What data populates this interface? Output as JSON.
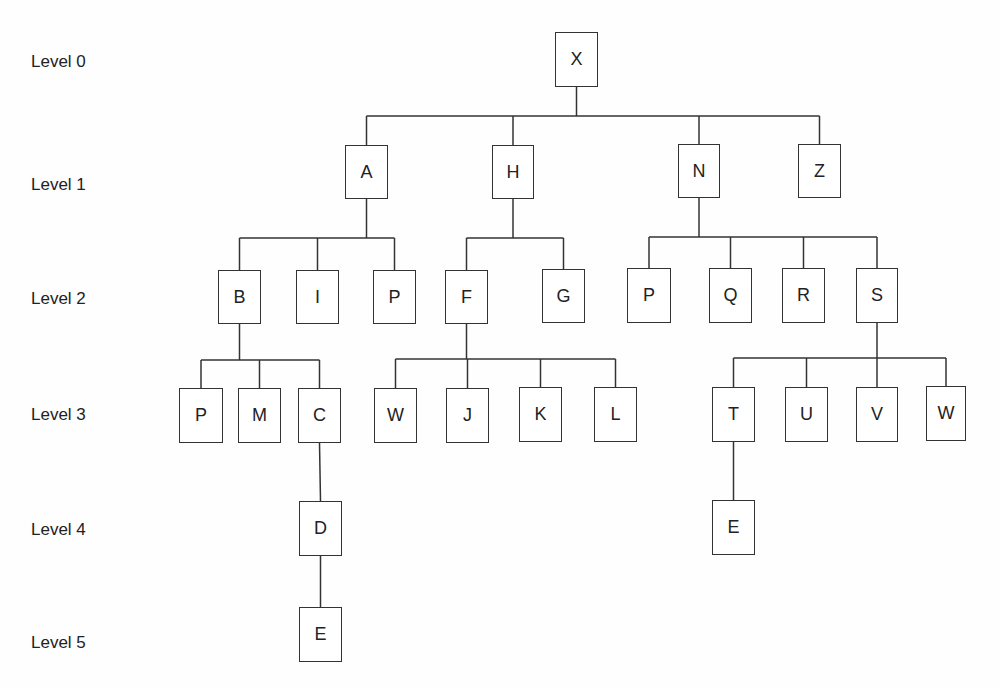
{
  "diagram": {
    "type": "tree",
    "levels": [
      {
        "label": "Level 0",
        "y": 62
      },
      {
        "label": "Level 1",
        "y": 185
      },
      {
        "label": "Level 2",
        "y": 299
      },
      {
        "label": "Level 3",
        "y": 415
      },
      {
        "label": "Level 4",
        "y": 530
      },
      {
        "label": "Level 5",
        "y": 643
      }
    ],
    "nodes": [
      {
        "id": "X",
        "label": "X",
        "level": 0,
        "x": 555,
        "y": 32,
        "w": 43,
        "h": 55
      },
      {
        "id": "A",
        "label": "A",
        "level": 1,
        "x": 345,
        "y": 145,
        "w": 43,
        "h": 54
      },
      {
        "id": "H",
        "label": "H",
        "level": 1,
        "x": 492,
        "y": 145,
        "w": 42,
        "h": 54
      },
      {
        "id": "N",
        "label": "N",
        "level": 1,
        "x": 678,
        "y": 144,
        "w": 42,
        "h": 54
      },
      {
        "id": "Z",
        "label": "Z",
        "level": 1,
        "x": 798,
        "y": 144,
        "w": 43,
        "h": 54
      },
      {
        "id": "B",
        "label": "B",
        "level": 2,
        "x": 218,
        "y": 270,
        "w": 43,
        "h": 54
      },
      {
        "id": "I",
        "label": "I",
        "level": 2,
        "x": 296,
        "y": 270,
        "w": 43,
        "h": 54
      },
      {
        "id": "P1",
        "label": "P",
        "level": 2,
        "x": 373,
        "y": 270,
        "w": 43,
        "h": 54
      },
      {
        "id": "F",
        "label": "F",
        "level": 2,
        "x": 445,
        "y": 270,
        "w": 43,
        "h": 54
      },
      {
        "id": "G",
        "label": "G",
        "level": 2,
        "x": 542,
        "y": 269,
        "w": 43,
        "h": 54
      },
      {
        "id": "P2",
        "label": "P",
        "level": 2,
        "x": 627,
        "y": 268,
        "w": 44,
        "h": 55
      },
      {
        "id": "Q",
        "label": "Q",
        "level": 2,
        "x": 709,
        "y": 268,
        "w": 43,
        "h": 55
      },
      {
        "id": "R",
        "label": "R",
        "level": 2,
        "x": 782,
        "y": 268,
        "w": 43,
        "h": 55
      },
      {
        "id": "S",
        "label": "S",
        "level": 2,
        "x": 856,
        "y": 268,
        "w": 42,
        "h": 55
      },
      {
        "id": "P3",
        "label": "P",
        "level": 3,
        "x": 179,
        "y": 388,
        "w": 44,
        "h": 55
      },
      {
        "id": "M",
        "label": "M",
        "level": 3,
        "x": 238,
        "y": 388,
        "w": 43,
        "h": 55
      },
      {
        "id": "C",
        "label": "C",
        "level": 3,
        "x": 298,
        "y": 388,
        "w": 43,
        "h": 55
      },
      {
        "id": "W1",
        "label": "W",
        "level": 3,
        "x": 374,
        "y": 388,
        "w": 43,
        "h": 55
      },
      {
        "id": "J",
        "label": "J",
        "level": 3,
        "x": 446,
        "y": 388,
        "w": 43,
        "h": 55
      },
      {
        "id": "K",
        "label": "K",
        "level": 3,
        "x": 519,
        "y": 387,
        "w": 43,
        "h": 55
      },
      {
        "id": "L",
        "label": "L",
        "level": 3,
        "x": 594,
        "y": 387,
        "w": 43,
        "h": 55
      },
      {
        "id": "T",
        "label": "T",
        "level": 3,
        "x": 712,
        "y": 387,
        "w": 43,
        "h": 55
      },
      {
        "id": "U",
        "label": "U",
        "level": 3,
        "x": 785,
        "y": 387,
        "w": 43,
        "h": 55
      },
      {
        "id": "V",
        "label": "V",
        "level": 3,
        "x": 856,
        "y": 387,
        "w": 42,
        "h": 55
      },
      {
        "id": "W2",
        "label": "W",
        "level": 3,
        "x": 926,
        "y": 386,
        "w": 40,
        "h": 55
      },
      {
        "id": "D",
        "label": "D",
        "level": 4,
        "x": 299,
        "y": 501,
        "w": 43,
        "h": 55
      },
      {
        "id": "E1",
        "label": "E",
        "level": 4,
        "x": 712,
        "y": 500,
        "w": 43,
        "h": 55
      },
      {
        "id": "E2",
        "label": "E",
        "level": 5,
        "x": 299,
        "y": 607,
        "w": 43,
        "h": 55
      }
    ],
    "edges": [
      {
        "parent": "X",
        "children": [
          "A",
          "H",
          "N",
          "Z"
        ],
        "bar_y": 116
      },
      {
        "parent": "A",
        "children": [
          "B",
          "I",
          "P1"
        ],
        "bar_y": 238
      },
      {
        "parent": "H",
        "children": [
          "F",
          "G"
        ],
        "bar_y": 238
      },
      {
        "parent": "N",
        "children": [
          "P2",
          "Q",
          "R",
          "S"
        ],
        "bar_y": 237
      },
      {
        "parent": "B",
        "children": [
          "P3",
          "M",
          "C"
        ],
        "bar_y": 360
      },
      {
        "parent": "F",
        "children": [
          "W1",
          "J",
          "K",
          "L"
        ],
        "bar_y": 359
      },
      {
        "parent": "S",
        "children": [
          "T",
          "U",
          "V",
          "W2"
        ],
        "bar_y": 358
      },
      {
        "parent": "C",
        "children": [
          "D"
        ],
        "bar_y": null
      },
      {
        "parent": "D",
        "children": [
          "E2"
        ],
        "bar_y": null
      },
      {
        "parent": "T",
        "children": [
          "E1"
        ],
        "bar_y": null
      }
    ],
    "colors": {
      "line": "#333333",
      "text": "#222222",
      "background": "#fefefe"
    }
  }
}
